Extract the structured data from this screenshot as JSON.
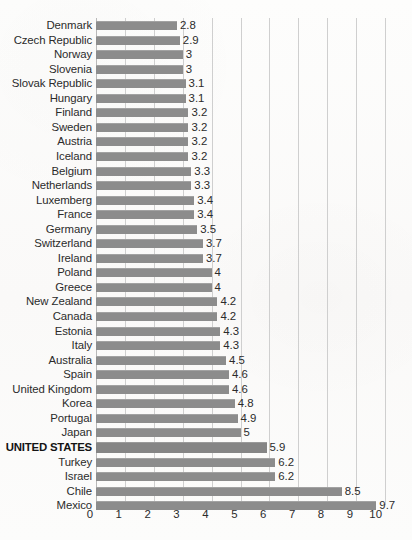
{
  "chart_data": {
    "type": "bar",
    "orientation": "horizontal",
    "title": "",
    "subtitle": "",
    "xlabel": "",
    "ylabel": "",
    "xlim": [
      0,
      10
    ],
    "xticks": [
      "0",
      "1",
      "2",
      "3",
      "4",
      "5",
      "6",
      "7",
      "8",
      "9",
      "10"
    ],
    "grid": true,
    "legend": null,
    "highlight_category": "UNITED STATES",
    "bar_color": "#8c8c8c",
    "background_color": "#fbfbfa",
    "text_color": "#2b2b2b",
    "gridline_color": "#cfcfcf",
    "categories": [
      "Denmark",
      "Czech Republic",
      "Norway",
      "Slovenia",
      "Slovak Republic",
      "Hungary",
      "Finland",
      "Sweden",
      "Austria",
      "Iceland",
      "Belgium",
      "Netherlands",
      "Luxemberg",
      "France",
      "Germany",
      "Switzerland",
      "Ireland",
      "Poland",
      "Greece",
      "New Zealand",
      "Canada",
      "Estonia",
      "Italy",
      "Australia",
      "Spain",
      "United Kingdom",
      "Korea",
      "Portugal",
      "Japan",
      "UNITED STATES",
      "Turkey",
      "Israel",
      "Chile",
      "Mexico"
    ],
    "values": [
      2.8,
      2.9,
      3,
      3,
      3.1,
      3.1,
      3.2,
      3.2,
      3.2,
      3.2,
      3.3,
      3.3,
      3.4,
      3.4,
      3.5,
      3.7,
      3.7,
      4,
      4,
      4.2,
      4.2,
      4.3,
      4.3,
      4.5,
      4.6,
      4.6,
      4.8,
      4.9,
      5,
      5.9,
      6.2,
      6.2,
      8.5,
      9.7
    ],
    "value_labels": [
      "2.8",
      "2.9",
      "3",
      "3",
      "3.1",
      "3.1",
      "3.2",
      "3.2",
      "3.2",
      "3.2",
      "3.3",
      "3.3",
      "3.4",
      "3.4",
      "3.5",
      "3.7",
      "3.7",
      "4",
      "4",
      "4.2",
      "4.2",
      "4.3",
      "4.3",
      "4.5",
      "4.6",
      "4.6",
      "4.8",
      "4.9",
      "5",
      "5.9",
      "6.2",
      "6.2",
      "8.5",
      "9.7"
    ]
  }
}
